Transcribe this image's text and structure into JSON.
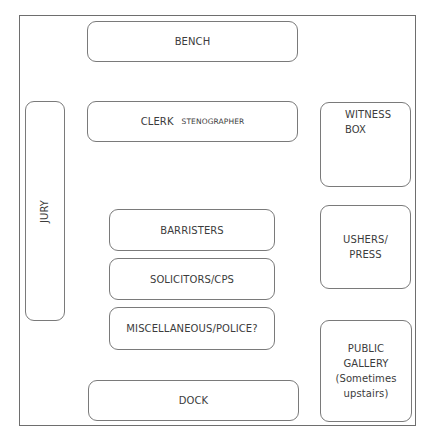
{
  "diagram": {
    "title": "",
    "type": "courtroom-layout",
    "areas": {
      "bench": {
        "label": "BENCH"
      },
      "clerk": {
        "label": "CLERK",
        "sublabel": "STENOGRAPHER"
      },
      "jury": {
        "label": "JURY"
      },
      "witness_box": {
        "lines": [
          "WITNESS",
          "BOX"
        ]
      },
      "ushers_press": {
        "lines": [
          "USHERS/",
          "PRESS"
        ]
      },
      "public_gallery": {
        "lines": [
          "PUBLIC",
          "GALLERY",
          "(Sometimes",
          "upstairs)"
        ]
      },
      "barristers": {
        "label": "BARRISTERS"
      },
      "solicitors": {
        "label": "SOLICITORS/CPS"
      },
      "misc": {
        "label": "MISCELLANEOUS/POLICE?"
      },
      "dock": {
        "label": "DOCK"
      }
    },
    "colors": {
      "border": "#7a7a7a",
      "text": "#3c3c3c",
      "background": "#ffffff"
    }
  }
}
